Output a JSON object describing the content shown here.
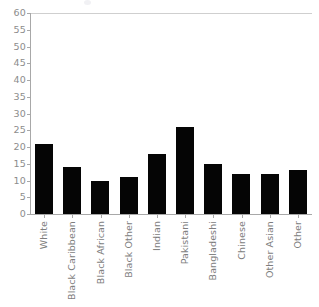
{
  "chart_data": {
    "type": "bar",
    "title": "",
    "subtitle": "",
    "xlabel": "",
    "ylabel": "",
    "categories": [
      "White",
      "Black Caribbean",
      "Black African",
      "Black Other",
      "Indian",
      "Pakistani",
      "Bangladeshi",
      "Chinese",
      "Other Asian",
      "Other"
    ],
    "values": [
      21,
      14,
      10,
      11,
      18,
      26,
      15,
      12,
      12,
      13
    ],
    "ylim": [
      0,
      60
    ],
    "ytick_values": [
      0,
      5,
      10,
      15,
      20,
      25,
      30,
      35,
      40,
      45,
      50,
      55,
      60
    ],
    "ytick_labels": [
      "0",
      "5",
      "10",
      "15",
      "20",
      "25",
      "30",
      "35",
      "40",
      "45",
      "50",
      "55",
      "60"
    ],
    "grid": "top-line-only",
    "legend": "none",
    "bar_color": "#050505",
    "axis_color": "#a8a8a8",
    "gridline_color": "#cfcfcf",
    "tick_label_color": "#8c8c8c",
    "category_label_color": "#7d7d7d",
    "background_color": "#ffffff",
    "category_label_rotation": -90
  }
}
